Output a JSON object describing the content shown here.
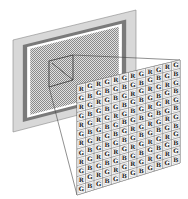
{
  "diagram": {
    "title": "",
    "colors": {
      "panel_outer": "#d6d6d6",
      "panel_border_dark": "#7a7a7a",
      "panel_border_white": "#ffffff",
      "sensor_checker_a": "#9a9a9a",
      "sensor_checker_b": "#e0e0e0",
      "grid_line": "#555555",
      "grid_cell": "#ffffff",
      "zoom_lines": "#444444"
    },
    "back_panel": {
      "outer": [
        [
          13,
          40
        ],
        [
          136,
          10
        ],
        [
          136,
          100
        ],
        [
          13,
          132
        ]
      ],
      "selection": [
        [
          49,
          61
        ],
        [
          73,
          55
        ],
        [
          73,
          80
        ],
        [
          49,
          87
        ]
      ]
    },
    "front_grid": {
      "corners": [
        [
          77,
          85
        ],
        [
          180,
          60
        ],
        [
          180,
          163
        ],
        [
          77,
          195
        ]
      ],
      "rows": 12,
      "cols": 12,
      "cells": [
        [
          "R",
          "G",
          "R",
          "G",
          "R",
          "G",
          "R",
          "G",
          "R",
          "G",
          "R",
          "G"
        ],
        [
          "G",
          "B",
          "G",
          "B",
          "G",
          "B",
          "G",
          "B",
          "G",
          "B",
          "G",
          "B"
        ],
        [
          "R",
          "G",
          "R",
          "G",
          "B",
          "G",
          "R",
          "G",
          "R",
          "G",
          "R",
          "G"
        ],
        [
          "G",
          "B",
          "G",
          "B",
          "G",
          "B",
          "G",
          "B",
          "G",
          "B",
          "G",
          "B"
        ],
        [
          "R",
          "G",
          "R",
          "G",
          "R",
          "G",
          "B",
          "G",
          "R",
          "G",
          "R",
          "G"
        ],
        [
          "G",
          "B",
          "G",
          "B",
          "G",
          "B",
          "G",
          "B",
          "G",
          "B",
          "G",
          "B"
        ],
        [
          "R",
          "G",
          "R",
          "G",
          "B",
          "G",
          "R",
          "G",
          "R",
          "G",
          "R",
          "G"
        ],
        [
          "G",
          "B",
          "G",
          "B",
          "G",
          "B",
          "G",
          "B",
          "G",
          "B",
          "G",
          "B"
        ],
        [
          "R",
          "G",
          "R",
          "G",
          "R",
          "G",
          "R",
          "G",
          "R",
          "G",
          "R",
          "G"
        ],
        [
          "G",
          "B",
          "G",
          "B",
          "G",
          "B",
          "G",
          "B",
          "G",
          "B",
          "G",
          "B"
        ],
        [
          "R",
          "G",
          "R",
          "G",
          "R",
          "G",
          "R",
          "G",
          "R",
          "G",
          "R",
          "G"
        ],
        [
          "G",
          "B",
          "G",
          "B",
          "G",
          "B",
          "G",
          "B",
          "G",
          "B",
          "G",
          "B"
        ]
      ]
    }
  }
}
